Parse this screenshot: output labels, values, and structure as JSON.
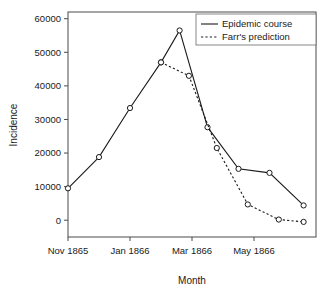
{
  "chart_data": {
    "type": "line",
    "title": "",
    "xlabel": "Month",
    "ylabel": "Incidence",
    "ylim": [
      -5000,
      62000
    ],
    "yticks": [
      0,
      10000,
      20000,
      30000,
      40000,
      50000,
      60000
    ],
    "ytick_labels": [
      "0",
      "10000",
      "20000",
      "30000",
      "40000",
      "50000",
      "60000"
    ],
    "x": [
      "Nov 1865",
      "Dec 1865",
      "Jan 1866",
      "Feb 1866",
      "Mar 1866",
      "Apr 1866",
      "May 1866",
      "Jun 1866",
      "Jul 1866"
    ],
    "xtick_positions": [
      0,
      2,
      4,
      6
    ],
    "xtick_labels": [
      "Nov 1865",
      "Jan 1866",
      "Mar 1866",
      "May 1866"
    ],
    "grid": false,
    "legend_position": "top-right",
    "series": [
      {
        "name": "Epidemic course",
        "style": "solid",
        "x": [
          0,
          1,
          2,
          3,
          3.6,
          4.5,
          5.5,
          6.5,
          7.6
        ],
        "values": [
          9500,
          18800,
          33400,
          47000,
          56500,
          27700,
          15300,
          14100,
          4400
        ]
      },
      {
        "name": "Farr's prediction",
        "style": "dashed",
        "x": [
          3,
          3.9,
          4.8,
          5.8,
          6.8,
          7.6
        ],
        "values": [
          47000,
          43000,
          21500,
          4700,
          200,
          -500
        ]
      }
    ],
    "legend": [
      {
        "label": "Epidemic course",
        "style": "solid"
      },
      {
        "label": "Farr's prediction",
        "style": "dashed"
      }
    ]
  }
}
